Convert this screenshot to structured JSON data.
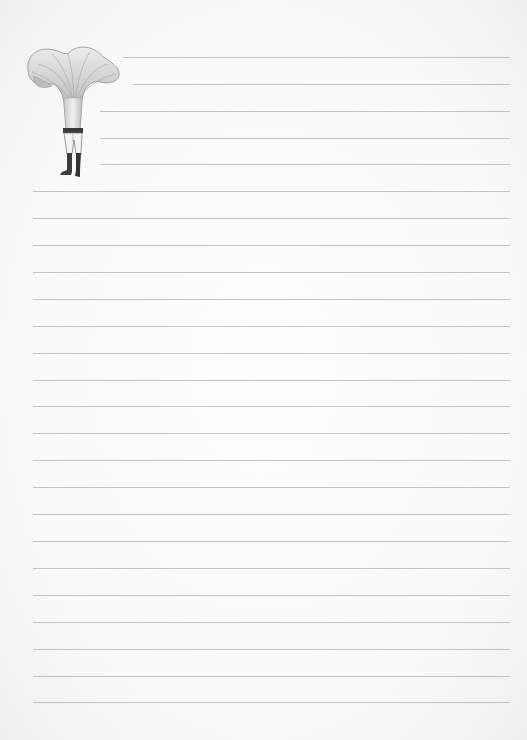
{
  "page": {
    "type": "lined-notepaper",
    "background_color": "#f9f9f8",
    "rule_color": "#b9b9b9"
  },
  "illustration": {
    "subject": "mushroom-headed-figure",
    "description": "Chanterelle mushroom cap atop a figure in trousers and boots"
  },
  "rules": [
    {
      "y": 57,
      "x1": 123,
      "x2": 510
    },
    {
      "y": 84,
      "x1": 133,
      "x2": 510
    },
    {
      "y": 111,
      "x1": 100,
      "x2": 510
    },
    {
      "y": 138,
      "x1": 100,
      "x2": 510
    },
    {
      "y": 164,
      "x1": 100,
      "x2": 510
    },
    {
      "y": 191,
      "x1": 33,
      "x2": 510
    },
    {
      "y": 218,
      "x1": 33,
      "x2": 510
    },
    {
      "y": 245,
      "x1": 33,
      "x2": 510
    },
    {
      "y": 272,
      "x1": 33,
      "x2": 510
    },
    {
      "y": 299,
      "x1": 33,
      "x2": 510
    },
    {
      "y": 326,
      "x1": 33,
      "x2": 510
    },
    {
      "y": 353,
      "x1": 33,
      "x2": 510
    },
    {
      "y": 380,
      "x1": 33,
      "x2": 510
    },
    {
      "y": 406,
      "x1": 33,
      "x2": 510
    },
    {
      "y": 433,
      "x1": 33,
      "x2": 510
    },
    {
      "y": 460,
      "x1": 33,
      "x2": 510
    },
    {
      "y": 487,
      "x1": 33,
      "x2": 510
    },
    {
      "y": 514,
      "x1": 33,
      "x2": 510
    },
    {
      "y": 541,
      "x1": 33,
      "x2": 510
    },
    {
      "y": 568,
      "x1": 33,
      "x2": 510
    },
    {
      "y": 595,
      "x1": 33,
      "x2": 510
    },
    {
      "y": 622,
      "x1": 33,
      "x2": 510
    },
    {
      "y": 649,
      "x1": 33,
      "x2": 510
    },
    {
      "y": 676,
      "x1": 33,
      "x2": 510
    },
    {
      "y": 702,
      "x1": 33,
      "x2": 510
    }
  ]
}
